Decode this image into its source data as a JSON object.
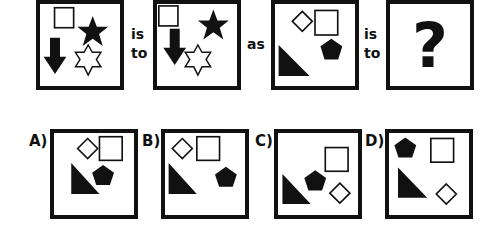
{
  "puzzle": {
    "type": "visual-analogy",
    "connectors": {
      "is": "is",
      "to": "to",
      "as": "as"
    },
    "question_mark": "?",
    "colors": {
      "ink": "#111111",
      "background": "#ffffff"
    },
    "stem": [
      {
        "id": "figure-1",
        "shapes": [
          "outline-square",
          "filled-star",
          "filled-down-arrow",
          "outline-hexagram"
        ]
      },
      {
        "id": "figure-2",
        "shapes": [
          "outline-square",
          "filled-down-arrow",
          "filled-star",
          "outline-hexagram"
        ]
      },
      {
        "id": "figure-3",
        "shapes": [
          "outline-diamond",
          "outline-square",
          "filled-pentagon",
          "filled-right-triangle"
        ]
      },
      {
        "id": "figure-4",
        "shapes": [
          "question-mark"
        ]
      }
    ],
    "options": [
      {
        "label": "A)",
        "shapes": [
          "outline-diamond",
          "outline-square",
          "filled-right-triangle",
          "filled-pentagon"
        ]
      },
      {
        "label": "B)",
        "shapes": [
          "outline-diamond",
          "outline-square",
          "filled-right-triangle",
          "filled-pentagon"
        ]
      },
      {
        "label": "C)",
        "shapes": [
          "outline-square",
          "filled-right-triangle",
          "filled-pentagon",
          "outline-diamond"
        ]
      },
      {
        "label": "D)",
        "shapes": [
          "filled-pentagon",
          "outline-square",
          "filled-right-triangle",
          "outline-diamond"
        ]
      }
    ]
  }
}
